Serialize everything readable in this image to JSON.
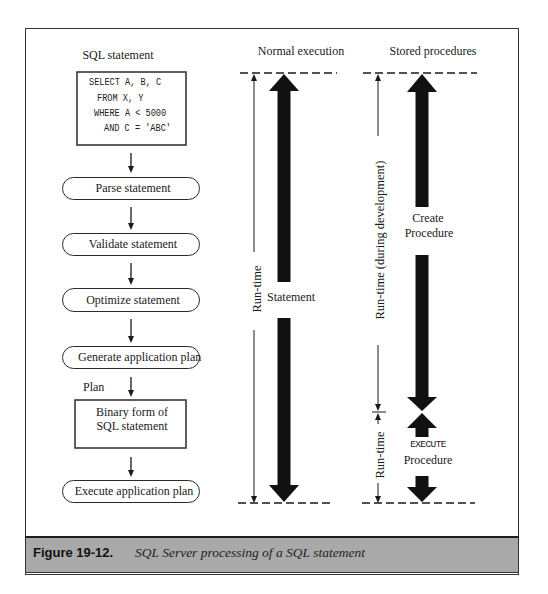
{
  "figure": {
    "columns": {
      "sql": {
        "title": "SQL statement"
      },
      "normal": {
        "title": "Normal execution"
      },
      "stored": {
        "title": "Stored procedures"
      }
    },
    "sql_code": [
      "SELECT A, B, C",
      "FROM X, Y",
      "WHERE A < 5000",
      "AND C = 'ABC'"
    ],
    "steps": [
      "Parse statement",
      "Validate statement",
      "Optimize statement",
      "Generate application plan"
    ],
    "plan_label": "Plan",
    "binary_box": [
      "Binary form of",
      "SQL statement"
    ],
    "final_step": "Execute application plan",
    "normal_execution": {
      "runtime_label": "Run-time",
      "arrow_label": "Statement"
    },
    "stored_procedures": {
      "dev_runtime_label": "Run-time (during development)",
      "create_label": [
        "Create",
        "Procedure"
      ],
      "runtime_label": "Run-time",
      "execute_label": [
        "EXECUTE",
        "Procedure"
      ]
    }
  },
  "caption": {
    "number": "Figure 19-12.",
    "text": "SQL Server processing of a SQL statement"
  },
  "colors": {
    "ink": "#1a1a1a",
    "caption_bar": "#a9a9a9",
    "frame": "#333333",
    "background": "#ffffff"
  }
}
